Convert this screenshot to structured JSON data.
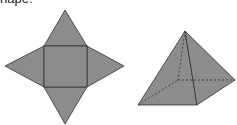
{
  "caption": "hape:",
  "figures": {
    "net": {
      "label": "square pyramid net",
      "fill": "#8c8c8c",
      "stroke": "#333333"
    },
    "pyramid": {
      "label": "square pyramid solid",
      "fill": "#8c8c8c",
      "stroke": "#333333"
    }
  }
}
